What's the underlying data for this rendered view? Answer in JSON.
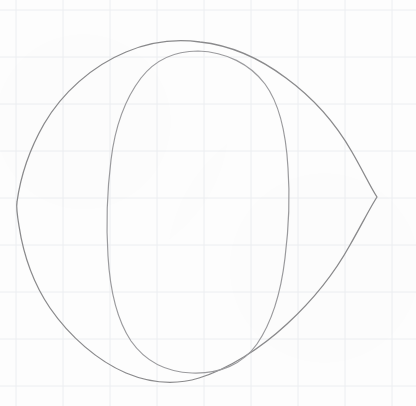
{
  "canvas": {
    "width": 416,
    "height": 406,
    "background_color": "#fdfdfd",
    "title": "Hand-drawn pencil sketch on graph paper"
  },
  "grid": {
    "visible": true,
    "line_color": "#eceef1",
    "major_line_color": "#e4e7ea",
    "spacing_px": 47,
    "offset_x_px": 16,
    "offset_y_px": 10,
    "line_width_px": 1,
    "vertical_lines_x": [
      16,
      63,
      110,
      157,
      204,
      251,
      298,
      345,
      392
    ],
    "horizontal_lines_y": [
      10,
      57,
      104,
      151,
      198,
      245,
      292,
      339,
      386
    ]
  },
  "drawing": {
    "medium": "pencil",
    "stroke_color": "#8a8a8c",
    "stroke_color_light": "#9b9b9e",
    "stroke_width_px": 1.3,
    "subject": "letter O / eye outline",
    "shapes": [
      {
        "name": "outer-contour",
        "description": "large rounded lens shape with pointed cusps at left and right",
        "left_cusp": {
          "x": 17,
          "y": 202
        },
        "right_cusp": {
          "x": 377,
          "y": 197
        },
        "top_point": {
          "x": 200,
          "y": 42
        },
        "bottom_point": {
          "x": 196,
          "y": 381
        },
        "width_px": 360,
        "height_px": 339
      },
      {
        "name": "inner-contour",
        "description": "tall rounded oval nested inside the outer contour",
        "left_point": {
          "x": 108,
          "y": 215
        },
        "right_point": {
          "x": 288,
          "y": 210
        },
        "top_point": {
          "x": 198,
          "y": 51
        },
        "bottom_point": {
          "x": 192,
          "y": 373
        },
        "width_px": 180,
        "height_px": 322
      }
    ]
  }
}
